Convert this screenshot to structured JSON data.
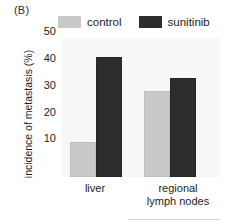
{
  "panel": {
    "label": "(B)"
  },
  "legend": {
    "entries": [
      {
        "label": "control",
        "color": "#c9c9c7"
      },
      {
        "label": "sunitinib",
        "color": "#2d2d2d"
      }
    ]
  },
  "axes": {
    "y_title": "incidence of metastasis (%)",
    "y_ticks": [
      "50",
      "40",
      "30",
      "20",
      "10"
    ],
    "x_categories": [
      {
        "line1": "liver",
        "line2": ""
      },
      {
        "line1": "regional",
        "line2": "lymph nodes"
      }
    ]
  },
  "chart_data": {
    "type": "bar",
    "title": "(B)",
    "xlabel": "",
    "ylabel": "incidence of metastasis (%)",
    "categories": [
      "liver",
      "regional lymph nodes"
    ],
    "series": [
      {
        "name": "control",
        "values": [
          13,
          32
        ],
        "color": "#c9c9c7"
      },
      {
        "name": "sunitinib",
        "values": [
          45,
          37
        ],
        "color": "#2d2d2d"
      }
    ],
    "ylim": [
      0,
      52
    ],
    "yticks": [
      10,
      20,
      30,
      40,
      50
    ],
    "grid": false,
    "legend_position": "top"
  }
}
